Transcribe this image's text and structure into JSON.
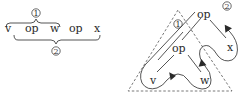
{
  "left_expression": {
    "tokens": [
      "v",
      "op",
      "w",
      "op",
      "x"
    ],
    "top_brace_label": "1",
    "bottom_brace_label": "2"
  },
  "right_tree": {
    "root": {
      "label": "op",
      "marker": "2"
    },
    "inner": {
      "label": "op",
      "marker": "1"
    },
    "leaves": {
      "v": "v",
      "w": "w",
      "x": "x"
    }
  },
  "colors": {
    "ink": "#2a2a2a",
    "dashed": "#555555"
  }
}
